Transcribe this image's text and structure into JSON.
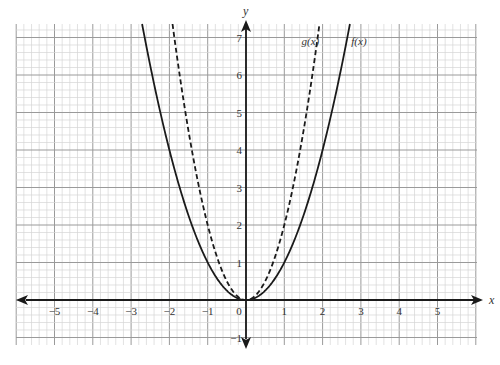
{
  "chart_data": {
    "type": "line",
    "title": "",
    "xlabel": "x",
    "ylabel": "y",
    "xlim": [
      -6.0,
      6.0
    ],
    "ylim": [
      -1.2,
      7.35
    ],
    "grid": true,
    "grid_minor_step": 0.2,
    "grid_major_step": 1,
    "x_ticks": [
      -5,
      -4,
      -3,
      -2,
      -1,
      0,
      1,
      2,
      3,
      4,
      5
    ],
    "x_tick_labels": [
      "−5",
      "−4",
      "−3",
      "−2",
      "−1",
      "0",
      "1",
      "2",
      "3",
      "4",
      "5"
    ],
    "y_ticks": [
      -1,
      1,
      2,
      3,
      4,
      5,
      6,
      7
    ],
    "y_tick_labels": [
      "−1",
      "1",
      "2",
      "3",
      "4",
      "5",
      "6",
      "7"
    ],
    "legend": "none (inline curve labels)",
    "series": [
      {
        "name": "f(x)",
        "style": "solid",
        "formula": "x^2",
        "coefficient": 1,
        "x": [
          -2.7,
          -2,
          -1,
          0,
          1,
          2,
          2.7
        ],
        "y": [
          7.29,
          4,
          1,
          0,
          1,
          4,
          7.29
        ],
        "label_position": {
          "x": 2.75,
          "y": 6.9
        }
      },
      {
        "name": "g(x)",
        "style": "dashed",
        "formula": "2x^2",
        "coefficient": 2,
        "x": [
          -1.9,
          -1.5,
          -1,
          -0.5,
          0,
          0.5,
          1,
          1.5,
          1.9
        ],
        "y": [
          7.22,
          4.5,
          2,
          0.5,
          0,
          0.5,
          2,
          4.5,
          7.22
        ],
        "label_position": {
          "x": 1.45,
          "y": 6.9
        }
      }
    ]
  },
  "labels": {
    "x_axis": "x",
    "y_axis": "y",
    "f_label": "f(x)",
    "g_label": "g(x)",
    "origin": "0"
  },
  "colors": {
    "axis": "#1a1a1a",
    "curve": "#1a1a1a",
    "grid_minor": "#d6d6d6",
    "grid_major": "#9a9a9a",
    "background": "#ffffff"
  }
}
